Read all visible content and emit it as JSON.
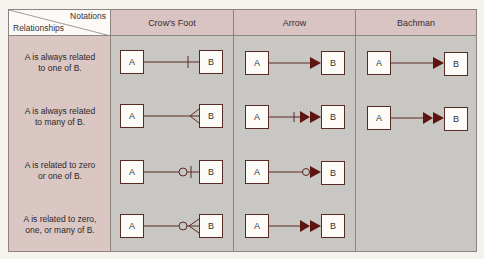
{
  "corner": {
    "top_label": "Notations",
    "bottom_label": "Relationships"
  },
  "columns": [
    {
      "label": "Crow's Foot"
    },
    {
      "label": "Arrow"
    },
    {
      "label": "Bachman"
    }
  ],
  "rows": [
    {
      "line1": "A is always related",
      "line2": "to one of B."
    },
    {
      "line1": "A is always related",
      "line2": "to many of B."
    },
    {
      "line1": "A is related to zero",
      "line2": "or one of B."
    },
    {
      "line1": "A is related to zero,",
      "line2": "one, or many of B."
    }
  ],
  "entities": {
    "a": "A",
    "b": "B"
  },
  "notations": {
    "crows_foot": [
      "one-bar",
      "crow-foot",
      "circle-bar",
      "circle-crow-foot"
    ],
    "arrow": [
      "single-arrow",
      "bar-double-arrow",
      "circle-arrow",
      "double-arrow"
    ],
    "bachman": [
      "single-arrow",
      "double-arrow",
      "none",
      "none"
    ]
  },
  "colors": {
    "header": "#d9c3c3",
    "left_column": "#dac7c4",
    "cell_background": "#c9c7c3",
    "line": "#5a2a24",
    "arrowhead": "#5e1410"
  }
}
